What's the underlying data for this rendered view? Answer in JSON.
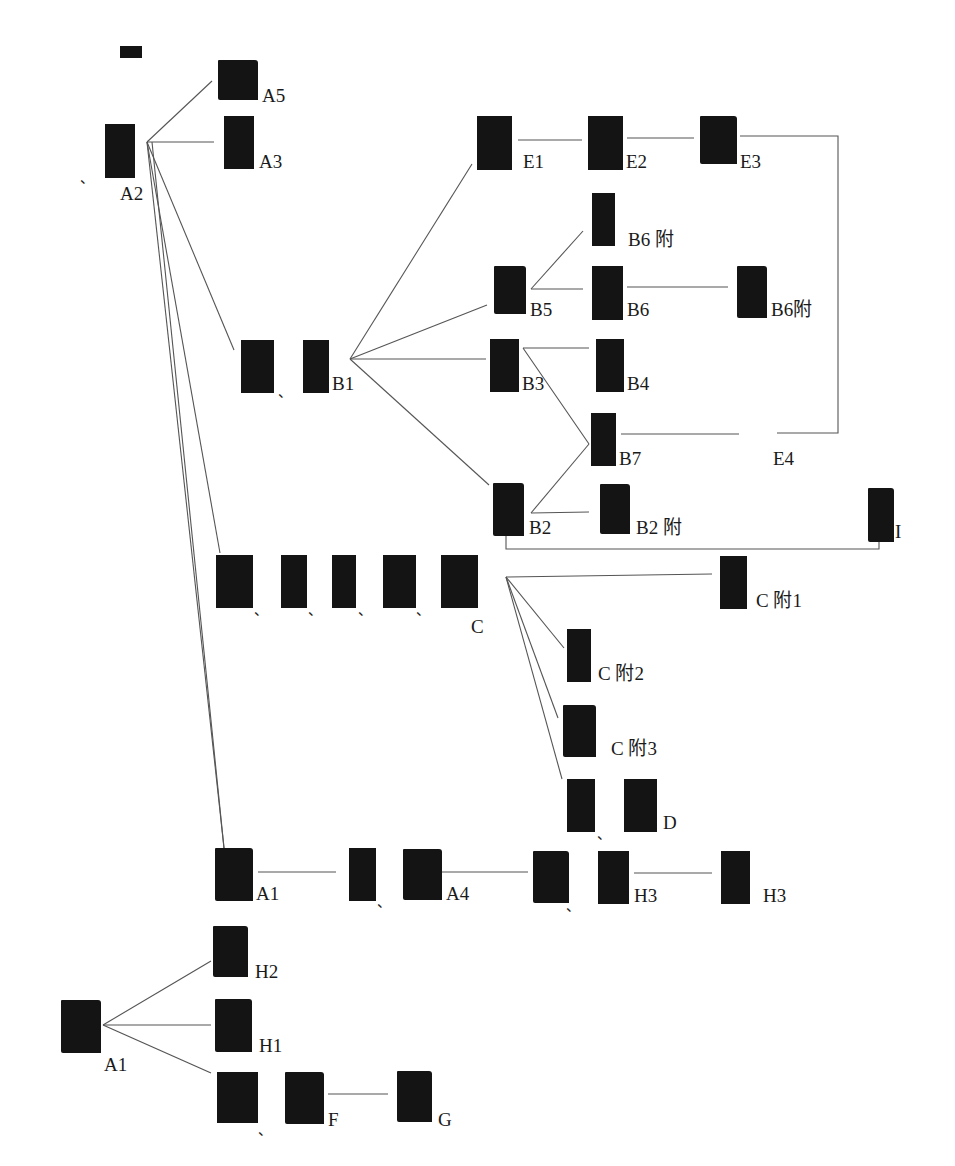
{
  "diagram": {
    "type": "evolution-tree",
    "line_color": "#555555",
    "tile_color": "#141414",
    "glyph_color": "#f2f2f2",
    "separator": "、",
    "nodes": {
      "a2_root_variant": {
        "glyph": "⿘",
        "label": ""
      },
      "a2": {
        "glyph": "⿘",
        "label": "A2"
      },
      "a5": {
        "glyph": "⿘",
        "label": "A5"
      },
      "a3": {
        "glyph": "⿘",
        "label": "A3"
      },
      "b1_variant": {
        "glyph": "⿘",
        "label": ""
      },
      "b1": {
        "glyph": "⿘",
        "label": "B1"
      },
      "e1": {
        "glyph": "⿘",
        "label": "E1"
      },
      "e2": {
        "glyph": "⿘",
        "label": "E2"
      },
      "e3": {
        "glyph": "⿘",
        "label": "E3"
      },
      "b6_appendix_top": {
        "glyph": "⿘",
        "label": "B6 附"
      },
      "b5": {
        "glyph": "⿘",
        "label": "B5"
      },
      "b6": {
        "glyph": "⿘",
        "label": "B6"
      },
      "b6_appendix_right": {
        "glyph": "⿘",
        "label": "B6附"
      },
      "b3": {
        "glyph": "⿘",
        "label": "B3"
      },
      "b4": {
        "glyph": "⿘",
        "label": "B4"
      },
      "b7": {
        "glyph": "⿘",
        "label": "B7"
      },
      "e4": {
        "glyph": "⿘",
        "label": "E4"
      },
      "b2": {
        "glyph": "⿘",
        "label": "B2"
      },
      "b2_appendix": {
        "glyph": "⿘",
        "label": "B2 附"
      },
      "i": {
        "glyph": "⿘",
        "label": "I"
      },
      "c_variant_1": {
        "glyph": "⿘",
        "label": ""
      },
      "c_variant_2": {
        "glyph": "⿘",
        "label": ""
      },
      "c_variant_3": {
        "glyph": "⿘",
        "label": ""
      },
      "c_variant_4": {
        "glyph": "⿘",
        "label": ""
      },
      "c": {
        "glyph": "⿘",
        "label": "C"
      },
      "c_appendix_1": {
        "glyph": "⿘",
        "label": "C 附1"
      },
      "c_appendix_2": {
        "glyph": "⿘",
        "label": "C 附2"
      },
      "c_appendix_3": {
        "glyph": "⿘",
        "label": "C 附3"
      },
      "d_variant": {
        "glyph": "⿘",
        "label": ""
      },
      "d": {
        "glyph": "⿘",
        "label": "D"
      },
      "a1_row": {
        "glyph": "⿘",
        "label": "A1"
      },
      "a4_variant": {
        "glyph": "⿘",
        "label": ""
      },
      "a4": {
        "glyph": "⿘",
        "label": "A4"
      },
      "h3_variant": {
        "glyph": "⿘",
        "label": ""
      },
      "h3_a": {
        "glyph": "⿘",
        "label": "H3"
      },
      "h3_b": {
        "glyph": "⿘",
        "label": "H3"
      },
      "a1_root": {
        "glyph": "⿘",
        "label": "A1"
      },
      "h2": {
        "glyph": "⿘",
        "label": "H2"
      },
      "h1": {
        "glyph": "⿘",
        "label": "H1"
      },
      "f_variant": {
        "glyph": "⿘",
        "label": ""
      },
      "f": {
        "glyph": "⿘",
        "label": "F"
      },
      "g": {
        "glyph": "⿘",
        "label": "G"
      }
    },
    "edges": [
      [
        "a2",
        "a5"
      ],
      [
        "a2",
        "a3"
      ],
      [
        "a2",
        "b1"
      ],
      [
        "a2",
        "c"
      ],
      [
        "a2",
        "a1_row"
      ],
      [
        "b1",
        "e1"
      ],
      [
        "b1",
        "b5"
      ],
      [
        "b1",
        "b3"
      ],
      [
        "b1",
        "b2"
      ],
      [
        "e1",
        "e2"
      ],
      [
        "e2",
        "e3"
      ],
      [
        "e3",
        "e4"
      ],
      [
        "b5",
        "b6_appendix_top"
      ],
      [
        "b5",
        "b6"
      ],
      [
        "b6",
        "b6_appendix_right"
      ],
      [
        "b3",
        "b4"
      ],
      [
        "b3",
        "b7"
      ],
      [
        "b2",
        "b7"
      ],
      [
        "b2",
        "b2_appendix"
      ],
      [
        "b2",
        "i"
      ],
      [
        "b7",
        "e4"
      ],
      [
        "c",
        "c_appendix_1"
      ],
      [
        "c",
        "c_appendix_2"
      ],
      [
        "c",
        "c_appendix_3"
      ],
      [
        "c",
        "d"
      ],
      [
        "a1_row",
        "a4"
      ],
      [
        "a4",
        "h3_a"
      ],
      [
        "h3_a",
        "h3_b"
      ],
      [
        "a1_root",
        "h2"
      ],
      [
        "a1_root",
        "h1"
      ],
      [
        "a1_root",
        "f"
      ],
      [
        "f",
        "g"
      ]
    ]
  }
}
